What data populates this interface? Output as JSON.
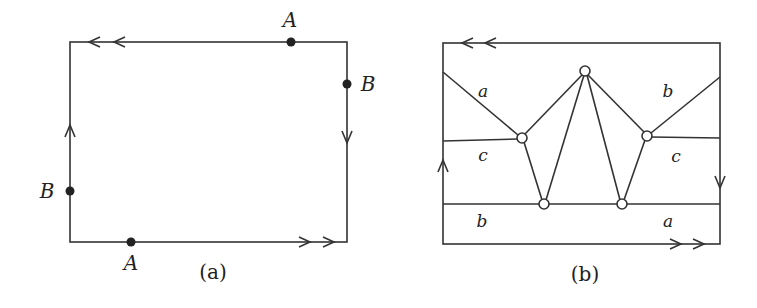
{
  "figure_a": {
    "caption": "(a)",
    "rect": {
      "x1": 70,
      "y1": 42,
      "x2": 347,
      "y2": 242
    },
    "points": [
      {
        "label": "A",
        "x": 291,
        "y": 42,
        "lx": 290,
        "ly": 27
      },
      {
        "label": "B",
        "x": 347,
        "y": 84,
        "lx": 368,
        "ly": 91
      },
      {
        "label": "B",
        "x": 70,
        "y": 191,
        "lx": 47,
        "ly": 198
      },
      {
        "label": "A",
        "x": 131,
        "y": 242,
        "lx": 131,
        "ly": 270
      }
    ],
    "edge_arrows": {
      "top": "double-left",
      "right": "single-down",
      "bottom": "double-right",
      "left": "single-up"
    }
  },
  "figure_b": {
    "caption": "(b)",
    "rect": {
      "x1": 443,
      "y1": 43,
      "x2": 720,
      "y2": 244
    },
    "vertices": [
      {
        "id": "top",
        "x": 585,
        "y": 71
      },
      {
        "id": "mid-left",
        "x": 522,
        "y": 138
      },
      {
        "id": "mid-right",
        "x": 647,
        "y": 136
      },
      {
        "id": "bottom-left",
        "x": 544,
        "y": 204
      },
      {
        "id": "bottom-right",
        "x": 622,
        "y": 204
      }
    ],
    "region_labels": [
      {
        "text": "a",
        "x": 483,
        "y": 97
      },
      {
        "text": "b",
        "x": 668,
        "y": 97
      },
      {
        "text": "c",
        "x": 483,
        "y": 161
      },
      {
        "text": "c",
        "x": 676,
        "y": 162
      },
      {
        "text": "b",
        "x": 482,
        "y": 227
      },
      {
        "text": "a",
        "x": 668,
        "y": 227
      }
    ],
    "edge_arrows": {
      "top": "double-left",
      "right": "single-down",
      "bottom": "double-right",
      "left": "single-up"
    }
  }
}
